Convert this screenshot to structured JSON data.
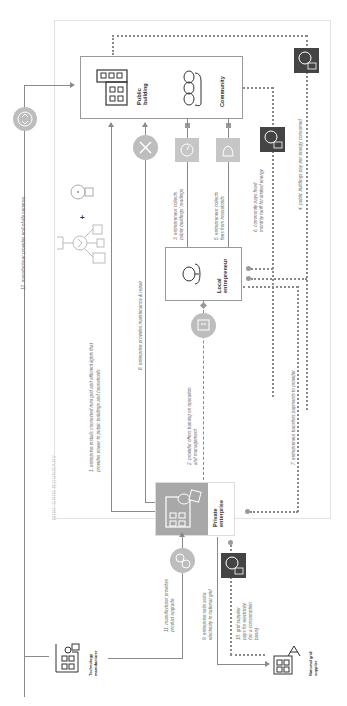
{
  "diagram": {
    "boundary_label": "MINI-GRID BOUNDARY",
    "nodes": {
      "public_building": "Public building",
      "community": "Community",
      "local_entrepreneur": "Local entrepreneur",
      "private_enterprise": "Private enterprise",
      "technology_manufacturer": "Technology manufacturer",
      "national_grid_supplier": "National grid supplier"
    },
    "flows": [
      {
        "id": 1,
        "label": "1. enterprise installs connected mini grid and efficient lights that provides power to public buildings and households",
        "line1": "1. enterprise installs connected mini grid and efficient lights that",
        "line2": "provides power to public buildings and households",
        "style": "solid"
      },
      {
        "id": 2,
        "label": "2. provider offers training on operation and management",
        "line1": "2. provider offers training on operation",
        "line2": "and management",
        "style": "dashed"
      },
      {
        "id": 3,
        "label": "3. entrepreneur collects public buildings' readings",
        "line1": "3. entrepreneur collects",
        "line2": "public buildings' readings",
        "style": "solid"
      },
      {
        "id": 4,
        "label": "4. public buildings pay per energy consumed",
        "line1": "4. public buildings pay per energy consumed",
        "style": "dotted"
      },
      {
        "id": 5,
        "label": "5. entrepreneur collects fees from households",
        "line1": "5. entrepreneur collects",
        "line2": "fees from households",
        "style": "solid"
      },
      {
        "id": 6,
        "label": "6. community pays fixed monthly tariff for limited energy",
        "line1": "6. community pays fixed",
        "line2": "monthly tariff for limited energy",
        "style": "dotted"
      },
      {
        "id": 7,
        "label": "7. entrepreneur transfers payments to provider",
        "line1": "7. entrepreneur transfers payments to provider",
        "style": "dotted"
      },
      {
        "id": 8,
        "label": "8. enterprise provides maintenance & repair",
        "line1": "8. enterprise provides maintenance & repair",
        "style": "solid"
      },
      {
        "id": 9,
        "label": "9. enterprise sells extra electricity to national grid",
        "line1": "9. enterprise sells extra",
        "line2": "electricity to national grid",
        "style": "solid"
      },
      {
        "id": 10,
        "label": "10. grid supplier pays for electricity (on a consumption basis)",
        "line1": "10. grid supplier",
        "line2": "pays for electricity",
        "line3": "(on a consumption",
        "line4": "basis)",
        "style": "dotted"
      },
      {
        "id": 11,
        "label": "11. manufacturer provides product upgrade",
        "line1": "11. manufacturer provides",
        "line2": "product upgrade",
        "style": "solid"
      },
      {
        "id": 12,
        "label": "12. manufacturer provides end-of-life services",
        "line1": "12. manufacturer provides end-of-life services",
        "style": "solid"
      }
    ],
    "icons": [
      "lightbulb-icon",
      "mini-grid-icon",
      "building-icon",
      "community-icon",
      "person-icon",
      "enterprise-icon",
      "factory-icon",
      "grid-tower-icon",
      "wrench-icon",
      "recycle-icon",
      "upgrade-icon",
      "meter-icon",
      "money-icon",
      "training-icon"
    ],
    "colors": {
      "line": "#8a8a8a",
      "dark_badge": "#444444",
      "light_badge": "#c6c6c6",
      "enterprise_fill": "#a8a8a8",
      "boundary": "#e2e2e2"
    }
  }
}
